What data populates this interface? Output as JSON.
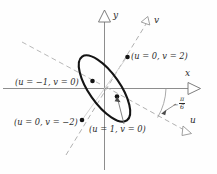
{
  "figure": {
    "kind": "math-diagram",
    "axes": {
      "x_label": "x",
      "y_label": "y",
      "u_label": "u",
      "v_label": "v"
    },
    "angle": {
      "sign": "−",
      "numerator": "π",
      "denominator": "6"
    },
    "point_labels": {
      "top_right": "(u = 0, v = 2)",
      "left": "(u = −1, v = 0)",
      "bottom_left": "(u = 0, v = −2)",
      "bottom_right": "(u = 1, v = 0)"
    },
    "colors": {
      "ink": "#2b2b2b",
      "curve": "#111111",
      "axis": "#8a8a8a",
      "dashed": "#a8a8a8",
      "faint": "#c9c9c9"
    }
  }
}
